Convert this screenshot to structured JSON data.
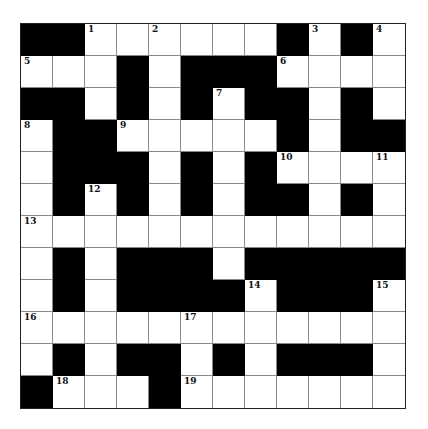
{
  "puzzle": {
    "rows": 12,
    "cols": 12,
    "colors": {
      "black": "#000000",
      "white": "#ffffff",
      "gridline": "#8a8a8a"
    },
    "layout": [
      "##......#.#.",
      "...#.###....",
      "##.#.#.##.#.",
      ".##.....#.##",
      ".###.#.#....",
      ".#.#.#.##.#.",
      "............",
      ".#.###.#####",
      ".#.####.###.",
      "............",
      ".#.##.#.###.",
      "#...#......."
    ],
    "numbers": [
      {
        "row": 0,
        "col": 2,
        "n": "1"
      },
      {
        "row": 0,
        "col": 4,
        "n": "2"
      },
      {
        "row": 0,
        "col": 9,
        "n": "3"
      },
      {
        "row": 0,
        "col": 11,
        "n": "4"
      },
      {
        "row": 1,
        "col": 0,
        "n": "5"
      },
      {
        "row": 1,
        "col": 8,
        "n": "6"
      },
      {
        "row": 2,
        "col": 6,
        "n": "7"
      },
      {
        "row": 3,
        "col": 0,
        "n": "8"
      },
      {
        "row": 3,
        "col": 3,
        "n": "9"
      },
      {
        "row": 4,
        "col": 8,
        "n": "10"
      },
      {
        "row": 4,
        "col": 11,
        "n": "11"
      },
      {
        "row": 5,
        "col": 2,
        "n": "12"
      },
      {
        "row": 6,
        "col": 0,
        "n": "13"
      },
      {
        "row": 8,
        "col": 7,
        "n": "14"
      },
      {
        "row": 8,
        "col": 11,
        "n": "15"
      },
      {
        "row": 9,
        "col": 0,
        "n": "16"
      },
      {
        "row": 9,
        "col": 5,
        "n": "17"
      },
      {
        "row": 11,
        "col": 1,
        "n": "18"
      },
      {
        "row": 11,
        "col": 5,
        "n": "19"
      }
    ]
  }
}
